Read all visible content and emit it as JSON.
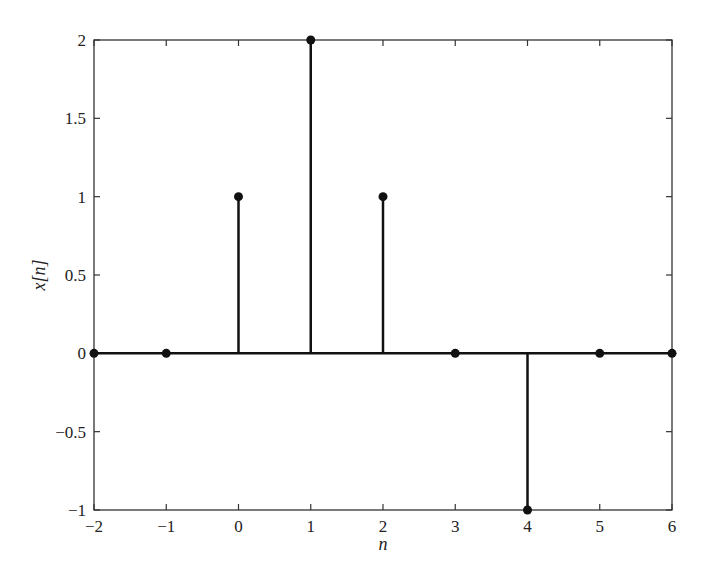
{
  "chart_data": {
    "type": "stem",
    "title": "",
    "xlabel": "n",
    "ylabel": "x[n]",
    "x": [
      -2,
      -1,
      0,
      1,
      2,
      3,
      4,
      5,
      6
    ],
    "values": [
      0,
      0,
      1,
      2,
      1,
      0,
      -1,
      0,
      0
    ],
    "xlim": [
      -2,
      6
    ],
    "ylim": [
      -1,
      2
    ],
    "xticks": [
      -2,
      -1,
      0,
      1,
      2,
      3,
      4,
      5,
      6
    ],
    "xtick_labels": [
      "−2",
      "−1",
      "0",
      "1",
      "2",
      "3",
      "4",
      "5",
      "6"
    ],
    "yticks": [
      -1,
      -0.5,
      0,
      0.5,
      1,
      1.5,
      2
    ],
    "ytick_labels": [
      "−1",
      "−0.5",
      "0",
      "0.5",
      "1",
      "1.5",
      "2"
    ],
    "grid": false,
    "legend": null,
    "colors": {
      "stem": "#111111",
      "axes": "#333333",
      "background": "#ffffff"
    }
  },
  "labels": {
    "xlabel": "n",
    "ylabel": "x[n]"
  }
}
